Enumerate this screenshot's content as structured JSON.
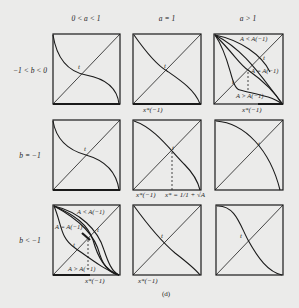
{
  "columns": [
    {
      "label": "0 < a < 1"
    },
    {
      "label": "a = 1"
    },
    {
      "label": "a > 1"
    }
  ],
  "rows": [
    {
      "label": "−1 < b < 0"
    },
    {
      "label": "b = −1"
    },
    {
      "label": "b < −1"
    }
  ],
  "panels": {
    "r1c1": {
      "point_label": "t"
    },
    "r1c2": {
      "point_label": "t",
      "axis_label": "x*(−1)"
    },
    "r1c3": {
      "point_label": "t",
      "curve_labels": [
        "A < A(−1)",
        "A = A(−1)",
        "A > A(−1)"
      ],
      "axis_label": "x*(−1)",
      "extra_label": "t"
    },
    "r2c1": {
      "point_label": "t"
    },
    "r2c2": {
      "point_label": "t",
      "axis_label": "x*(−1)",
      "axis_label2": "x* = 1/1 + √A"
    },
    "r2c3": {
      "point_label": "t"
    },
    "r3c1": {
      "point_label": "t",
      "curve_labels": [
        "A < A(−1)",
        "A = A(−1)",
        "A > A(−1)"
      ],
      "axis_label": "x*(−1)",
      "extra_label": "t"
    },
    "r3c2": {
      "point_label": "t",
      "axis_label": "x*(−1)"
    },
    "r3c3": {
      "point_label": "t"
    }
  },
  "caption": "(d)"
}
